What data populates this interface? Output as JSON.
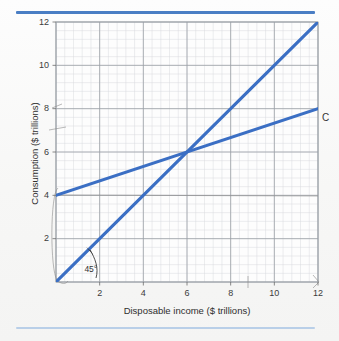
{
  "figure": {
    "background_color": "#f7f7f6",
    "top_rule_color": "#4a7ec4",
    "bottom_rule_color": "#b9cfe8"
  },
  "chart_data": {
    "type": "line",
    "title": "",
    "xlabel": "Disposable income ($ trillions)",
    "ylabel": "Consumption ($ trillions)",
    "xlim": [
      0,
      12
    ],
    "ylim": [
      0,
      12
    ],
    "xticks": [
      "2",
      "4",
      "6",
      "8",
      "10",
      "12"
    ],
    "xtick_values": [
      2,
      4,
      6,
      8,
      10,
      12
    ],
    "yticks": [
      "2",
      "4",
      "6",
      "8",
      "10",
      "12"
    ],
    "ytick_values": [
      2,
      4,
      6,
      8,
      10,
      12
    ],
    "grid": true,
    "minor_grid": true,
    "minor_divisions": 5,
    "legend": "none",
    "line_color": "#3b6fc4",
    "series": [
      {
        "name": "45-degree line",
        "label": "45°",
        "x": [
          0,
          12
        ],
        "y": [
          0,
          12
        ],
        "slope": 1,
        "intercept": 0,
        "color": "#3b6fc4"
      },
      {
        "name": "Consumption function",
        "label": "C",
        "x": [
          0,
          12
        ],
        "y": [
          4,
          8
        ],
        "slope": 0.3333,
        "intercept": 4,
        "color": "#3b6fc4"
      }
    ],
    "annotations": [
      {
        "name": "angle-label",
        "text": "45°",
        "x": 1.3,
        "y": 0.55
      },
      {
        "name": "curve-label",
        "text": "C",
        "x": 12.35,
        "y": 7.55
      },
      {
        "name": "intersection",
        "text": "",
        "x": 6,
        "y": 6
      }
    ]
  },
  "axes": {
    "x_title": "Disposable income ($ trillions)",
    "y_title": "Consumption ($ trillions)",
    "x_tick_labels": [
      "2",
      "4",
      "6",
      "8",
      "10",
      "12"
    ],
    "y_tick_labels": [
      "2",
      "4",
      "6",
      "8",
      "10",
      "12"
    ]
  },
  "labels": {
    "consumption_line": "C",
    "angle": "45°"
  }
}
